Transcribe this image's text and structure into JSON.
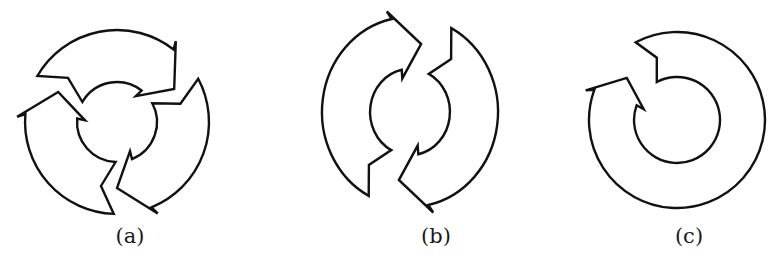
{
  "figure": {
    "panels": [
      {
        "id": "a",
        "label": "(a)",
        "description": "Circular ring split into three clockwise arrows",
        "arrow_count": 3,
        "direction": "clockwise",
        "center": [
          117,
          122
        ],
        "outer_radius": 92,
        "inner_radius": 40
      },
      {
        "id": "b",
        "label": "(b)",
        "description": "Circular ring split into two clockwise arrows",
        "arrow_count": 2,
        "direction": "clockwise",
        "center": [
          410,
          112
        ],
        "outer_radius": 88,
        "inner_radius": 40
      },
      {
        "id": "c",
        "label": "(c)",
        "description": "Single circular clockwise arrow forming a nearly closed ring",
        "arrow_count": 1,
        "direction": "clockwise",
        "center": [
          677,
          120
        ],
        "outer_radius": 88,
        "inner_radius": 43
      }
    ],
    "colors": {
      "stroke": "#111111",
      "fill": "#ffffff",
      "background": "#ffffff"
    }
  }
}
